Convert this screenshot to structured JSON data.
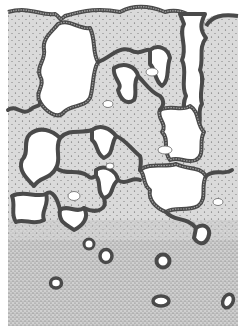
{
  "figure": {
    "kind": "black-and-white stippled histology illustration",
    "colors": {
      "background": "#ffffff",
      "stroma": "#d9d9d9",
      "stroma_dense": "#c4c4c4",
      "epithelium_outer": "#4a4a4a",
      "epithelium_inner": "#9a9a9a",
      "stipple": "#555555",
      "lumen": "#ffffff"
    },
    "regions": [
      {
        "name": "upper-glandular-zone",
        "description": "convoluted tubular glands with white lumens in light stippled stroma"
      },
      {
        "name": "lower-dense-zone",
        "description": "densely stippled stroma with small ring-shaped ducts"
      }
    ],
    "ducts_count": 6,
    "small_cell_clusters_count": 6
  }
}
